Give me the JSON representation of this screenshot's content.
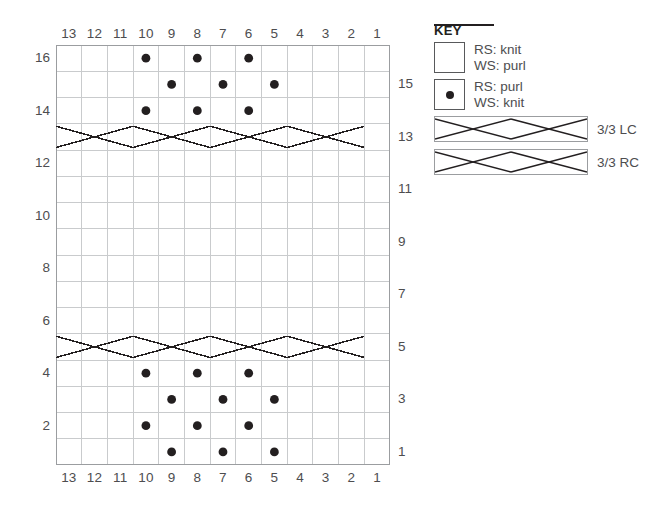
{
  "chart_data": {
    "type": "table",
    "columns": 13,
    "rows": 16,
    "column_labels_top": [
      "13",
      "12",
      "11",
      "10",
      "9",
      "8",
      "7",
      "6",
      "5",
      "4",
      "3",
      "2",
      "1"
    ],
    "column_labels_bottom": [
      "13",
      "12",
      "11",
      "10",
      "9",
      "8",
      "7",
      "6",
      "5",
      "4",
      "3",
      "2",
      "1"
    ],
    "row_labels_left": [
      "16",
      "14",
      "12",
      "10",
      "8",
      "6",
      "4",
      "2"
    ],
    "row_labels_right": [
      "15",
      "13",
      "11",
      "9",
      "7",
      "5",
      "3",
      "1"
    ],
    "row_label_left_rows": [
      16,
      14,
      12,
      10,
      8,
      6,
      4,
      2
    ],
    "row_label_right_rows": [
      15,
      13,
      11,
      9,
      7,
      5,
      3,
      1
    ],
    "legend_position": "right",
    "grid": true,
    "purl_dots": [
      {
        "row": 16,
        "cols": [
          10,
          8,
          6
        ]
      },
      {
        "row": 15,
        "cols": [
          9,
          7,
          5
        ]
      },
      {
        "row": 14,
        "cols": [
          10,
          8,
          6
        ]
      },
      {
        "row": 4,
        "cols": [
          10,
          8,
          6
        ]
      },
      {
        "row": 3,
        "cols": [
          9,
          7,
          5
        ]
      },
      {
        "row": 2,
        "cols": [
          10,
          8,
          6
        ]
      },
      {
        "row": 1,
        "cols": [
          9,
          7,
          5
        ]
      }
    ],
    "cables": [
      {
        "row": 13,
        "start_col": 13,
        "end_col": 8,
        "type": "3/3 LC"
      },
      {
        "row": 13,
        "start_col": 7,
        "end_col": 2,
        "type": "3/3 RC"
      },
      {
        "row": 5,
        "start_col": 13,
        "end_col": 8,
        "type": "3/3 LC"
      },
      {
        "row": 5,
        "start_col": 7,
        "end_col": 2,
        "type": "3/3 RC"
      }
    ]
  },
  "key": {
    "title": "KEY",
    "symbols": [
      {
        "swatch": "empty-square",
        "line1": "RS: knit",
        "line2": "WS: purl"
      },
      {
        "swatch": "dot-square",
        "line1": "RS: purl",
        "line2": "WS: knit"
      }
    ],
    "cables": [
      {
        "symbol": "cable-3-3-lc",
        "label": "3/3 LC"
      },
      {
        "symbol": "cable-3-3-rc",
        "label": "3/3 RC"
      }
    ]
  },
  "colors": {
    "grid_line": "#c9cbcd",
    "grid_border": "#9b9da0",
    "symbol": "#231f20",
    "text": "#4d4d4f",
    "background": "#ffffff"
  }
}
